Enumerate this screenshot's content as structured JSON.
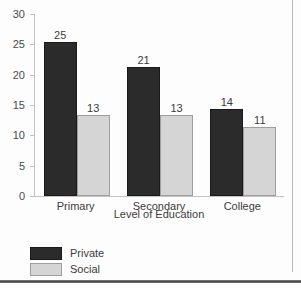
{
  "chart_data": {
    "type": "bar",
    "title": "",
    "xlabel": "Level of Education",
    "ylabel": "",
    "categories": [
      "Primary",
      "Secondary",
      "College"
    ],
    "series": [
      {
        "name": "Private",
        "values": [
          25,
          21,
          14
        ],
        "color": "#2b2b2b"
      },
      {
        "name": "Social",
        "values": [
          13,
          13,
          11
        ],
        "color": "#d5d5d5"
      }
    ],
    "ylim": [
      0,
      30
    ],
    "yticks": [
      0,
      5,
      10,
      15,
      20,
      25,
      30
    ],
    "ytick_labels": [
      "0",
      "5",
      "10",
      "15",
      "20",
      "25",
      "30"
    ],
    "grid": false,
    "legend_position": "bottom-left",
    "value_labels": true
  },
  "legend": {
    "items": [
      {
        "label": "Private",
        "swatch": "legend-swatch-private"
      },
      {
        "label": "Social",
        "swatch": "legend-swatch-social"
      }
    ]
  },
  "axis": {
    "x_title": "Level of Education"
  },
  "colors": {
    "private": "#2b2b2b",
    "social": "#d5d5d5",
    "axis": "#c2c2c2",
    "text": "#3c3c3c",
    "frame": "#b9b9b9"
  }
}
